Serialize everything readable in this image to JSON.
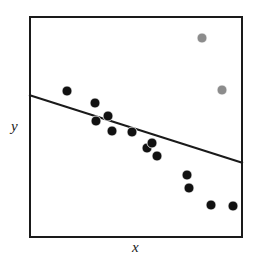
{
  "figure": {
    "background_color": "#ffffff",
    "frame": {
      "x0": 29,
      "y0": 16,
      "x1": 243,
      "y1": 238,
      "border_color": "#1a1a1a",
      "border_width": 2
    }
  },
  "axes": {
    "xlabel": "x",
    "ylabel": "y",
    "tick_labels_x": [],
    "tick_labels_y": [],
    "grid": false
  },
  "chart_data": {
    "type": "scatter",
    "title": "",
    "xlabel": "x",
    "ylabel": "y",
    "grid": false,
    "legend_position": "none",
    "xlim": [
      0,
      1
    ],
    "ylim": [
      0,
      1
    ],
    "colors": {
      "inlier": "#111111",
      "outlier": "#8c8c8c",
      "fit_line": "#1a1a1a"
    },
    "marker_diameter_px": 10,
    "series": [
      {
        "name": "inliers",
        "color": "#111111",
        "marker": "filled-circle",
        "points_px": [
          [
            67,
            91
          ],
          [
            95,
            103
          ],
          [
            108,
            116
          ],
          [
            96,
            121
          ],
          [
            112,
            131
          ],
          [
            132,
            132
          ],
          [
            147,
            148
          ],
          [
            152,
            143
          ],
          [
            157,
            156
          ],
          [
            187,
            175
          ],
          [
            189,
            188
          ],
          [
            211,
            205
          ],
          [
            233,
            206
          ]
        ]
      },
      {
        "name": "outliers",
        "color": "#8c8c8c",
        "marker": "filled-circle",
        "points_px": [
          [
            202,
            38
          ],
          [
            222,
            90
          ]
        ]
      }
    ],
    "fit_line": {
      "name": "regression-line",
      "color": "#1a1a1a",
      "width_px": 2,
      "x_start_px": 29,
      "y_start_px": 95,
      "x_end_px": 243,
      "y_end_px": 163,
      "slope_sign": "negative"
    }
  }
}
